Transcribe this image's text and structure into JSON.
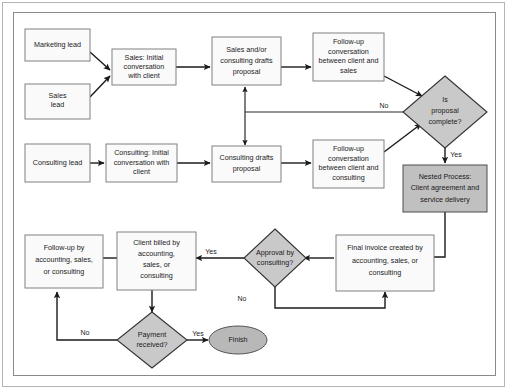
{
  "diagram": {
    "frame": {
      "label": "diagram-frame"
    },
    "colors": {
      "process_fill": "#fafafa",
      "process_stroke": "#808080",
      "nested_fill": "#c0c0c0",
      "decision_fill": "#c9c9c9",
      "terminator_fill": "#b8b8b8",
      "connector": "#1a1a1a",
      "canvas": "#ffffff"
    },
    "nodes": [
      {
        "id": "marketing_lead",
        "shape": "process",
        "lines": [
          "Marketing lead"
        ]
      },
      {
        "id": "sales_lead",
        "shape": "process",
        "lines": [
          "Sales",
          "lead"
        ]
      },
      {
        "id": "consulting_lead",
        "shape": "process",
        "lines": [
          "Consulting lead"
        ]
      },
      {
        "id": "sales_initial",
        "shape": "process",
        "lines": [
          "Sales: Initial",
          "conversation",
          "with client"
        ]
      },
      {
        "id": "consulting_initial",
        "shape": "process",
        "lines": [
          "Consulting: Initial",
          "conversation with",
          "client"
        ]
      },
      {
        "id": "sales_drafts",
        "shape": "process",
        "lines": [
          "Sales and/or",
          "consulting drafts",
          "proposal"
        ]
      },
      {
        "id": "consulting_drafts",
        "shape": "process",
        "lines": [
          "Consulting drafts",
          "proposal"
        ]
      },
      {
        "id": "followup_sales",
        "shape": "process",
        "lines": [
          "Follow-up",
          "conversation",
          "between client and",
          "sales"
        ]
      },
      {
        "id": "followup_consulting",
        "shape": "process",
        "lines": [
          "Follow-up",
          "conversation",
          "between client and",
          "consulting"
        ]
      },
      {
        "id": "proposal_complete",
        "shape": "decision",
        "lines": [
          "Is",
          "proposal",
          "complete?"
        ]
      },
      {
        "id": "nested_process",
        "shape": "nested",
        "lines": [
          "Nested Process:",
          "Client agreement and",
          "service delivery"
        ]
      },
      {
        "id": "final_invoice",
        "shape": "process",
        "lines": [
          "Final invoice created by",
          "accounting, sales, or",
          "consulting"
        ]
      },
      {
        "id": "approval_consulting",
        "shape": "decision",
        "lines": [
          "Approval by",
          "consulting?"
        ]
      },
      {
        "id": "client_billed",
        "shape": "process",
        "lines": [
          "Client billed by",
          "accounting,",
          "sales, or",
          "consulting"
        ]
      },
      {
        "id": "followup_accounting",
        "shape": "process",
        "lines": [
          "Follow-up by",
          "accounting, sales,",
          "or consulting"
        ]
      },
      {
        "id": "payment_received",
        "shape": "decision",
        "lines": [
          "Payment",
          "received?"
        ]
      },
      {
        "id": "finish",
        "shape": "terminator",
        "lines": [
          "Finish"
        ]
      }
    ],
    "edge_labels": {
      "proposal_no": "No",
      "proposal_yes": "Yes",
      "approval_yes": "Yes",
      "approval_no": "No",
      "payment_yes": "Yes",
      "payment_no": "No"
    },
    "edges": [
      {
        "from": "marketing_lead",
        "to": "sales_initial",
        "label": ""
      },
      {
        "from": "sales_lead",
        "to": "sales_initial",
        "label": ""
      },
      {
        "from": "sales_initial",
        "to": "sales_drafts",
        "label": ""
      },
      {
        "from": "sales_drafts",
        "to": "followup_sales",
        "label": ""
      },
      {
        "from": "followup_sales",
        "to": "proposal_complete",
        "label": ""
      },
      {
        "from": "consulting_lead",
        "to": "consulting_initial",
        "label": ""
      },
      {
        "from": "consulting_initial",
        "to": "consulting_drafts",
        "label": ""
      },
      {
        "from": "consulting_drafts",
        "to": "followup_consulting",
        "label": ""
      },
      {
        "from": "followup_consulting",
        "to": "proposal_complete",
        "label": ""
      },
      {
        "from": "sales_drafts",
        "to": "consulting_drafts",
        "label": ""
      },
      {
        "from": "proposal_complete",
        "to": "sales_drafts",
        "label": "No"
      },
      {
        "from": "proposal_complete",
        "to": "nested_process",
        "label": "Yes"
      },
      {
        "from": "nested_process",
        "to": "final_invoice",
        "label": ""
      },
      {
        "from": "final_invoice",
        "to": "approval_consulting",
        "label": ""
      },
      {
        "from": "approval_consulting",
        "to": "client_billed",
        "label": "Yes"
      },
      {
        "from": "approval_consulting",
        "to": "final_invoice",
        "label": "No"
      },
      {
        "from": "client_billed",
        "to": "payment_received",
        "label": ""
      },
      {
        "from": "payment_received",
        "to": "finish",
        "label": "Yes"
      },
      {
        "from": "payment_received",
        "to": "followup_accounting",
        "label": "No"
      },
      {
        "from": "followup_accounting",
        "to": "client_billed",
        "label": ""
      }
    ]
  }
}
